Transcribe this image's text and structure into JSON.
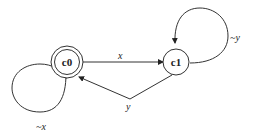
{
  "diagram": {
    "type": "state-machine",
    "states": [
      {
        "id": "c0",
        "label": "c0",
        "accepting": true
      },
      {
        "id": "c1",
        "label": "c1",
        "accepting": false
      }
    ],
    "transitions": [
      {
        "from": "c0",
        "to": "c1",
        "label": "x"
      },
      {
        "from": "c1",
        "to": "c0",
        "label": "y"
      },
      {
        "from": "c0",
        "to": "c0",
        "label": "~x"
      },
      {
        "from": "c1",
        "to": "c1",
        "label": "~y"
      }
    ]
  }
}
